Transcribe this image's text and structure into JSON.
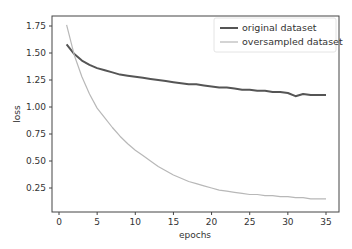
{
  "chart_data": {
    "type": "line",
    "title": "",
    "xlabel": "epochs",
    "ylabel": "loss",
    "xlim": [
      -0.8,
      36.7
    ],
    "ylim": [
      0.02,
      1.84
    ],
    "xticks": [
      0,
      5,
      10,
      15,
      20,
      25,
      30,
      35
    ],
    "yticks": [
      0.25,
      0.5,
      0.75,
      1.0,
      1.25,
      1.5,
      1.75
    ],
    "ytick_labels": [
      "0.25",
      "0.50",
      "0.75",
      "1.00",
      "1.25",
      "1.50",
      "1.75"
    ],
    "grid": false,
    "legend_position": "upper right",
    "x": [
      1,
      2,
      3,
      4,
      5,
      6,
      7,
      8,
      9,
      10,
      11,
      12,
      13,
      14,
      15,
      16,
      17,
      18,
      19,
      20,
      21,
      22,
      23,
      24,
      25,
      26,
      27,
      28,
      29,
      30,
      31,
      32,
      33,
      34,
      35
    ],
    "series": [
      {
        "name": "original dataset",
        "color": "#555555",
        "values": [
          1.58,
          1.49,
          1.43,
          1.39,
          1.36,
          1.34,
          1.32,
          1.3,
          1.29,
          1.28,
          1.27,
          1.26,
          1.25,
          1.24,
          1.23,
          1.22,
          1.21,
          1.21,
          1.2,
          1.19,
          1.18,
          1.18,
          1.17,
          1.16,
          1.16,
          1.15,
          1.15,
          1.14,
          1.14,
          1.13,
          1.1,
          1.12,
          1.11,
          1.11,
          1.11
        ]
      },
      {
        "name": "oversampled dataset",
        "color": "#b8b8b8",
        "values": [
          1.76,
          1.48,
          1.28,
          1.12,
          0.99,
          0.9,
          0.81,
          0.73,
          0.66,
          0.6,
          0.55,
          0.5,
          0.45,
          0.41,
          0.37,
          0.34,
          0.31,
          0.29,
          0.27,
          0.25,
          0.23,
          0.22,
          0.21,
          0.2,
          0.19,
          0.19,
          0.18,
          0.18,
          0.17,
          0.17,
          0.16,
          0.16,
          0.15,
          0.15,
          0.15
        ]
      }
    ]
  }
}
